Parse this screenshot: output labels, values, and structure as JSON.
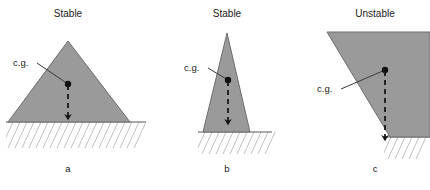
{
  "figure": {
    "caption_labels": [
      "a",
      "b",
      "c"
    ],
    "cg_label": "c.g.",
    "colors": {
      "body_fill": "#9a9a9a",
      "body_stroke": "#6e6e6e",
      "ground_line": "#4d4d4d",
      "hatch": "#b9b9b9",
      "vector": "#111111",
      "leader": "#3a3a3a",
      "text": "#1a1a1a",
      "background": "#ffffff"
    },
    "panels": [
      {
        "id": "a",
        "title": "Stable",
        "label": "a",
        "cg_label": "c.g.",
        "shape": "wide-triangle",
        "stability": "stable"
      },
      {
        "id": "b",
        "title": "Stable",
        "label": "b",
        "cg_label": "c.g.",
        "shape": "narrow-triangle",
        "stability": "stable"
      },
      {
        "id": "c",
        "title": "Unstable",
        "label": "c",
        "cg_label": "c.g.",
        "shape": "overhanging-wedge",
        "stability": "unstable"
      }
    ]
  }
}
